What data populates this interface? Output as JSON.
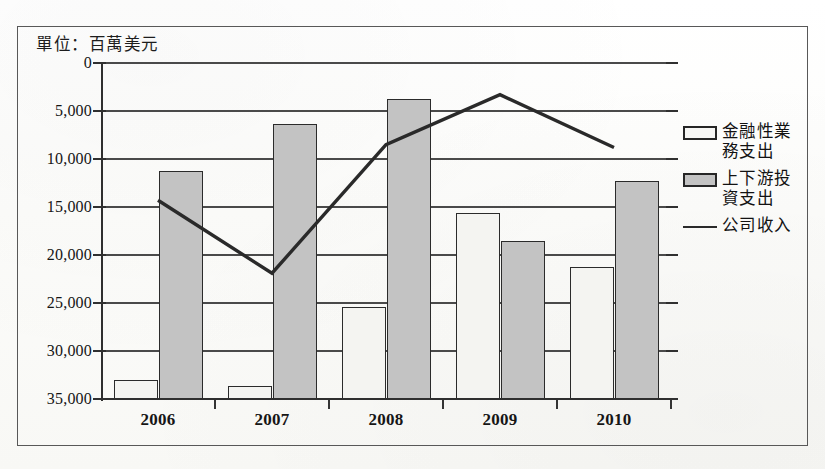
{
  "figure": {
    "unit_caption": "單位：百萬美元",
    "frame_color": "#585858",
    "background_color": "#fdfdfb"
  },
  "legend": {
    "position": "right",
    "items": [
      {
        "label": "金融性業務支出",
        "marker": "white-bar-swatch",
        "color": "#f4f4f1"
      },
      {
        "label": "上下游投資支出",
        "marker": "gray-bar-swatch",
        "color": "#c3c3c3"
      },
      {
        "label": "公司收入",
        "marker": "line-swatch",
        "color": "#2a2a2a"
      }
    ]
  },
  "axes": {
    "y_ticks": [
      "35,000",
      "30,000",
      "25,000",
      "20,000",
      "15,000",
      "10,000",
      "5,000",
      "0"
    ],
    "x_ticks": [
      "2006",
      "2007",
      "2008",
      "2009",
      "2010"
    ]
  },
  "chart_data": {
    "type": "bar",
    "title": "",
    "subtitle": "",
    "xlabel": "",
    "ylabel": "單位：百萬美元",
    "unit": "百萬美元",
    "categories": [
      "2006",
      "2007",
      "2008",
      "2009",
      "2010"
    ],
    "ylim": [
      0,
      35000
    ],
    "ytick_values": [
      0,
      5000,
      10000,
      15000,
      20000,
      25000,
      30000,
      35000
    ],
    "grid": true,
    "legend_position": "right",
    "series": [
      {
        "name": "金融性業務支出",
        "type": "bar",
        "color": "#f4f4f1",
        "edge_color": "#2b2b2b",
        "values": [
          2000,
          1350,
          9600,
          19400,
          13700
        ]
      },
      {
        "name": "上下游投資支出",
        "type": "bar",
        "color": "#c3c3c3",
        "edge_color": "#2b2b2b",
        "values": [
          23750,
          28650,
          31250,
          16500,
          22750
        ]
      },
      {
        "name": "公司收入",
        "type": "line",
        "color": "#2a2a2a",
        "values": [
          20700,
          13100,
          26500,
          31700,
          26200
        ]
      }
    ]
  }
}
